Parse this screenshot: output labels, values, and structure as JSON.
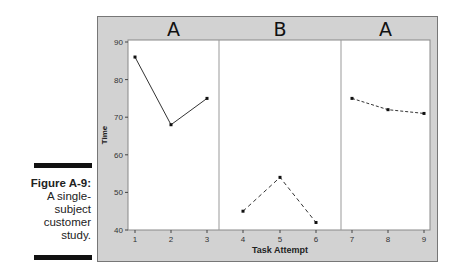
{
  "caption": {
    "figure_label": "Figure A-9:",
    "lines": [
      "A single-",
      "subject",
      "customer",
      "study."
    ]
  },
  "chart_data": {
    "type": "line",
    "title": "",
    "xlabel": "Task Attempt",
    "ylabel": "Time",
    "ylim": [
      40,
      90
    ],
    "yticks": [
      40,
      50,
      60,
      70,
      80,
      90
    ],
    "xticks": [
      1,
      2,
      3,
      4,
      5,
      6,
      7,
      8,
      9
    ],
    "panels": [
      {
        "label": "A",
        "x": [
          1,
          2,
          3
        ],
        "values": [
          86,
          68,
          75
        ],
        "line_style": "solid"
      },
      {
        "label": "B",
        "x": [
          4,
          5,
          6
        ],
        "values": [
          45,
          54,
          42
        ],
        "line_style": "dashed"
      },
      {
        "label": "A",
        "x": [
          7,
          8,
          9
        ],
        "values": [
          75,
          72,
          71
        ],
        "line_style": "dotted-dashed"
      }
    ],
    "grid": false,
    "legend": "none"
  },
  "colors": {
    "frame_bg": "#d2d2d2",
    "plot_bg": "#ffffff",
    "line": "#333333",
    "divider": "#999999"
  }
}
